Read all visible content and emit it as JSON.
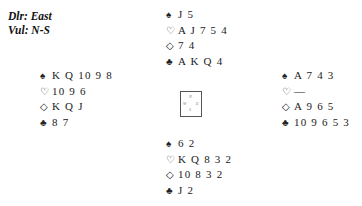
{
  "deal_info": {
    "dealer": "Dlr: East",
    "vulnerability": "Vul: N-S"
  },
  "suit_symbols": {
    "spades": "♠",
    "hearts": "♡",
    "diamonds": "◇",
    "clubs": "♣"
  },
  "hands": {
    "north": {
      "spades": "J 5",
      "hearts": "A J 7 5 4",
      "diamonds": "7 4",
      "clubs": "A K Q 4"
    },
    "west": {
      "spades": "K Q 10 9 8",
      "hearts": "10 9 6",
      "diamonds": "K Q J",
      "clubs": "8 7"
    },
    "east": {
      "spades": "A 7 4 3",
      "hearts": "—",
      "diamonds": "A 9 6 5",
      "clubs": "10 9 6 5 3"
    },
    "south": {
      "spades": "6 2",
      "hearts": "K Q 8 3 2",
      "diamonds": "10 8 3 2",
      "clubs": "J 2"
    }
  },
  "compass": {
    "n": "N",
    "s": "S",
    "w": "W",
    "e": "E"
  }
}
